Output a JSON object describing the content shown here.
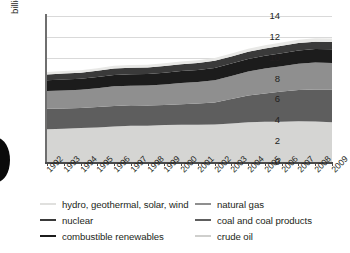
{
  "chart_data": {
    "type": "area",
    "title": "",
    "subtitle": "",
    "xlabel": "",
    "ylabel": "billion tonnes of oil equivalent",
    "ylim": [
      0,
      14
    ],
    "ytick_values": [
      0,
      2,
      4,
      6,
      8,
      10,
      12,
      14
    ],
    "ytick_labels": [
      "0",
      "2",
      "4",
      "6",
      "8",
      "10",
      "12",
      "14"
    ],
    "grid": true,
    "grid_axis": "y",
    "legend_position": "below",
    "stacked": true,
    "categories": [
      "1992",
      "1993",
      "1994",
      "1995",
      "1996",
      "1997",
      "1998",
      "1999",
      "2000",
      "2001",
      "2002",
      "2003",
      "2004",
      "2005",
      "2006",
      "2007",
      "2008",
      "2009"
    ],
    "series": [
      {
        "name": "crude oil",
        "color": "#d5d5d3",
        "values": [
          3.15,
          3.2,
          3.25,
          3.32,
          3.4,
          3.47,
          3.48,
          3.54,
          3.58,
          3.58,
          3.6,
          3.68,
          3.82,
          3.86,
          3.87,
          3.9,
          3.88,
          3.8
        ]
      },
      {
        "name": "coal and coal products",
        "color": "#5e5e5e",
        "values": [
          1.95,
          1.93,
          1.92,
          1.95,
          1.98,
          1.97,
          1.93,
          1.92,
          1.95,
          2.02,
          2.1,
          2.35,
          2.55,
          2.72,
          2.88,
          3.0,
          3.08,
          3.15
        ]
      },
      {
        "name": "natural gas",
        "color": "#8f8f8f",
        "values": [
          1.7,
          1.73,
          1.75,
          1.8,
          1.88,
          1.88,
          1.92,
          1.97,
          2.05,
          2.08,
          2.15,
          2.22,
          2.3,
          2.38,
          2.44,
          2.52,
          2.58,
          2.55
        ]
      },
      {
        "name": "combustible renewables",
        "color": "#1c1c1c",
        "values": [
          1.05,
          1.06,
          1.07,
          1.08,
          1.09,
          1.1,
          1.11,
          1.13,
          1.14,
          1.15,
          1.17,
          1.19,
          1.21,
          1.23,
          1.25,
          1.27,
          1.29,
          1.31
        ]
      },
      {
        "name": "nuclear",
        "color": "#3a3a3a",
        "values": [
          0.55,
          0.57,
          0.58,
          0.6,
          0.62,
          0.62,
          0.63,
          0.65,
          0.66,
          0.67,
          0.68,
          0.68,
          0.7,
          0.7,
          0.71,
          0.71,
          0.7,
          0.69
        ]
      },
      {
        "name": "hydro, geothermal, solar, wind",
        "color": "#e8e8e6",
        "values": [
          0.22,
          0.23,
          0.23,
          0.24,
          0.25,
          0.25,
          0.25,
          0.26,
          0.26,
          0.26,
          0.27,
          0.28,
          0.29,
          0.3,
          0.31,
          0.32,
          0.33,
          0.34
        ]
      }
    ]
  },
  "legend": {
    "left_column": [
      {
        "label": "hydro, geothermal, solar, wind",
        "color": "#e0e0de"
      },
      {
        "label": "nuclear",
        "color": "#3a3a3a"
      },
      {
        "label": "combustible renewables",
        "color": "#1c1c1c"
      }
    ],
    "right_column": [
      {
        "label": "natural gas",
        "color": "#8f8f8f"
      },
      {
        "label": "coal and coal products",
        "color": "#5e5e5e"
      },
      {
        "label": "crude oil",
        "color": "#cfcfcd"
      }
    ]
  }
}
